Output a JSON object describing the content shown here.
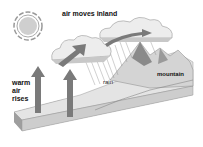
{
  "diagram": {
    "labels": {
      "air_moves_inland": "air moves inland",
      "warm_air_rises": "warm air rises",
      "rain": "rain",
      "mountain": "mountain"
    },
    "elements": [
      "sun",
      "clouds",
      "rising air arrows",
      "inland air arrows",
      "rain",
      "mountain",
      "land block"
    ]
  }
}
